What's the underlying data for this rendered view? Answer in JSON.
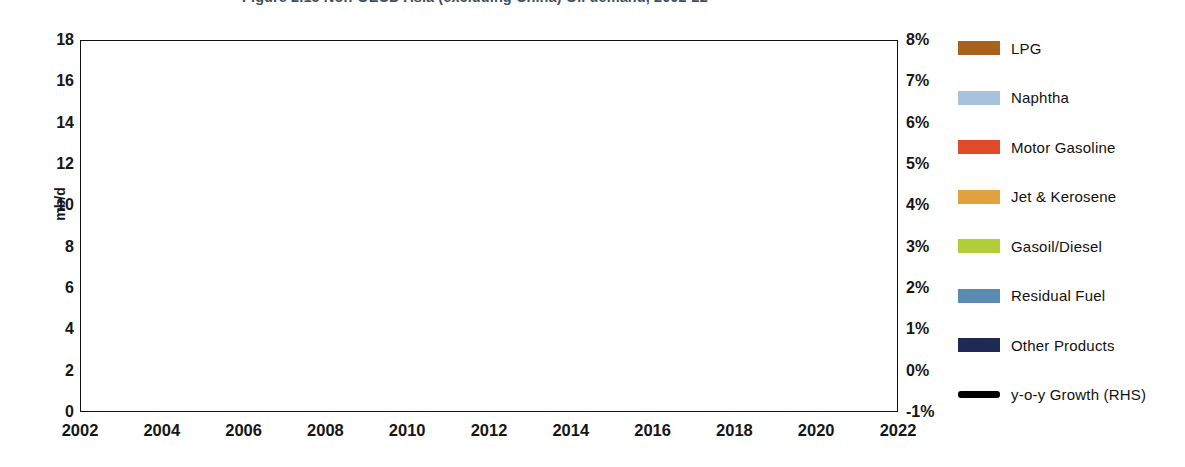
{
  "title": "Figure 2.15  Non-OECD Asia (excluding China) Oil demand, 2002-22",
  "axes": {
    "left": {
      "label": "mb/d",
      "ticks": [
        "18",
        "16",
        "14",
        "12",
        "10",
        "8",
        "6",
        "4",
        "2",
        "0"
      ],
      "min": 0,
      "max": 18
    },
    "right": {
      "ticks": [
        "8%",
        "7%",
        "6%",
        "5%",
        "4%",
        "3%",
        "2%",
        "1%",
        "0%",
        "-1%"
      ],
      "min": -1,
      "max": 8
    },
    "bottom": {
      "ticks": [
        "2002",
        "2004",
        "2006",
        "2008",
        "2010",
        "2012",
        "2014",
        "2016",
        "2018",
        "2020",
        "2022"
      ]
    }
  },
  "legend": {
    "items": [
      {
        "label": "LPG",
        "color": "#a8621b",
        "type": "area"
      },
      {
        "label": "Naphtha",
        "color": "#a8c2dd",
        "type": "area"
      },
      {
        "label": "Motor Gasoline",
        "color": "#e04a28",
        "type": "area"
      },
      {
        "label": "Jet & Kerosene",
        "color": "#dfa23f",
        "type": "area"
      },
      {
        "label": "Gasoil/Diesel",
        "color": "#b2cd3a",
        "type": "area"
      },
      {
        "label": "Residual Fuel",
        "color": "#5b8bb0",
        "type": "area"
      },
      {
        "label": "Other Products",
        "color": "#1f2a54",
        "type": "area"
      },
      {
        "label": "y-o-y Growth (RHS)",
        "color": "#000000",
        "type": "line"
      }
    ]
  },
  "chart_data": {
    "type": "area",
    "title": "Figure 2.15  Non-OECD Asia (excluding China) Oil demand, 2002-22",
    "xlabel": "",
    "ylabel": "mb/d",
    "y2label": "",
    "ylim": [
      0,
      18
    ],
    "y2lim": [
      -1,
      8
    ],
    "grid": true,
    "grid_style": "dashed-horizontal",
    "legend_position": "right",
    "stacked": true,
    "x": [
      2002,
      2003,
      2004,
      2005,
      2006,
      2007,
      2008,
      2009,
      2010,
      2011,
      2012,
      2013,
      2014,
      2015,
      2016,
      2017,
      2018,
      2019,
      2020,
      2021,
      2022
    ],
    "series": [
      {
        "name": "Other Products",
        "color": "#1f2a54",
        "values": [
          0.72,
          0.74,
          0.78,
          0.8,
          0.82,
          0.84,
          0.86,
          0.88,
          0.92,
          0.95,
          0.97,
          1.0,
          1.03,
          1.06,
          1.1,
          1.14,
          1.18,
          1.22,
          1.27,
          1.32,
          1.38
        ]
      },
      {
        "name": "Residual Fuel",
        "color": "#5b8bb0",
        "values": [
          1.28,
          1.3,
          1.32,
          1.33,
          1.34,
          1.35,
          1.34,
          1.33,
          1.35,
          1.37,
          1.38,
          1.4,
          1.42,
          1.45,
          1.52,
          1.68,
          1.8,
          1.95,
          1.72,
          1.58,
          1.5
        ]
      },
      {
        "name": "Gasoil/Diesel",
        "color": "#b2cd3a",
        "values": [
          2.28,
          2.36,
          2.52,
          2.62,
          2.72,
          2.86,
          2.9,
          2.98,
          3.16,
          3.3,
          3.44,
          3.56,
          3.7,
          3.86,
          4.06,
          4.24,
          4.44,
          4.64,
          4.84,
          5.04,
          5.24
        ]
      },
      {
        "name": "Jet & Kerosene",
        "color": "#dfa23f",
        "values": [
          0.78,
          0.79,
          0.81,
          0.82,
          0.84,
          0.86,
          0.86,
          0.87,
          0.9,
          0.93,
          0.96,
          0.99,
          1.02,
          1.06,
          1.1,
          1.14,
          1.18,
          1.22,
          1.26,
          1.3,
          1.34
        ]
      },
      {
        "name": "Motor Gasoline",
        "color": "#e04a28",
        "values": [
          0.98,
          1.02,
          1.1,
          1.16,
          1.22,
          1.3,
          1.34,
          1.4,
          1.5,
          1.6,
          1.7,
          1.8,
          1.92,
          2.04,
          2.18,
          2.3,
          2.42,
          2.54,
          2.66,
          2.78,
          2.9
        ]
      },
      {
        "name": "Naphtha",
        "color": "#a8c2dd",
        "values": [
          0.52,
          0.54,
          0.58,
          0.6,
          0.62,
          0.66,
          0.67,
          0.69,
          0.74,
          0.78,
          0.82,
          0.86,
          0.9,
          0.95,
          1.0,
          1.05,
          1.1,
          1.16,
          1.22,
          1.28,
          1.34
        ]
      },
      {
        "name": "LPG",
        "color": "#a8621b",
        "values": [
          0.64,
          0.66,
          0.71,
          0.74,
          0.78,
          0.83,
          0.85,
          0.89,
          0.96,
          1.02,
          1.08,
          1.14,
          1.21,
          1.28,
          1.36,
          1.44,
          1.52,
          1.61,
          1.7,
          1.8,
          1.9
        ]
      }
    ],
    "overlay_line": {
      "name": "y-o-y Growth (RHS)",
      "color": "#000000",
      "axis": "right",
      "unit": "%",
      "x": [
        2002,
        2003,
        2004,
        2005,
        2006,
        2007,
        2008,
        2009,
        2010,
        2011,
        2012,
        2013,
        2014,
        2015,
        2016,
        2017,
        2018,
        2019,
        2020,
        2021,
        2022
      ],
      "values": [
        3.2,
        2.4,
        6.9,
        0.7,
        3.4,
        6.1,
        3.3,
        -0.9,
        6.1,
        2.5,
        3.3,
        3.1,
        2.9,
        3.4,
        5.0,
        4.3,
        4.0,
        3.8,
        3.4,
        3.2,
        3.15
      ]
    }
  }
}
